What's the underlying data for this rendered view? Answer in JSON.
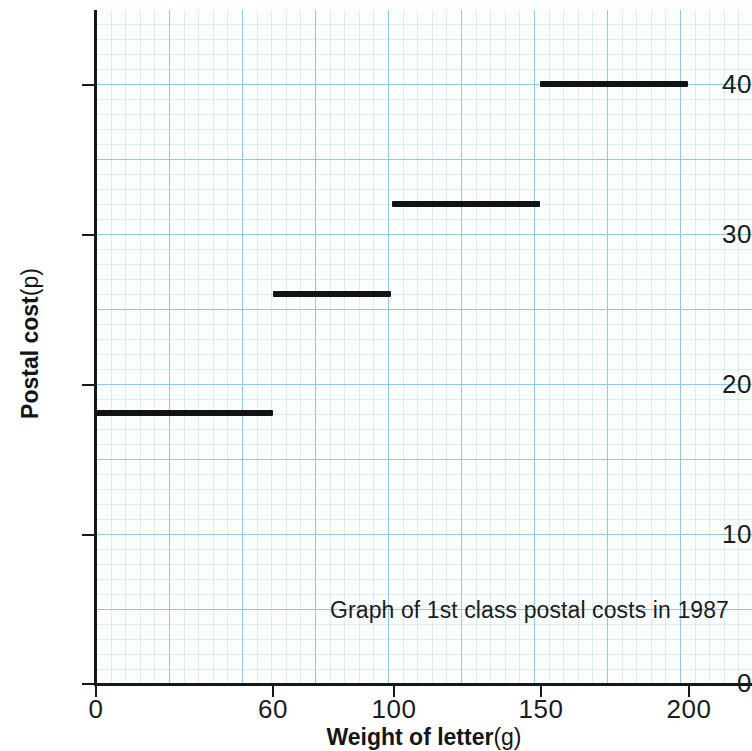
{
  "chart_data": {
    "type": "line",
    "subtype": "step",
    "title": "",
    "annotation": "Graph of 1st class postal costs in 1987",
    "xlabel_bold": "Weight of letter",
    "xlabel_unit": "(g)",
    "ylabel_bold": "Postal cost",
    "ylabel_unit": "(p)",
    "xlim": [
      0,
      225
    ],
    "ylim": [
      0,
      45
    ],
    "x_ticks": [
      0,
      60,
      100,
      150,
      200
    ],
    "x_tick_labels": [
      "0",
      "60",
      "100",
      "150",
      "200"
    ],
    "y_ticks": [
      0,
      10,
      20,
      30,
      40
    ],
    "y_tick_labels": [
      "0",
      "10",
      "20",
      "30",
      "40"
    ],
    "grid": "graph-paper light blue, major and minor",
    "legend": "none",
    "line_color": "#121315",
    "grid_color": "#6ebedc",
    "steps": [
      {
        "x_start": 0,
        "x_end": 60,
        "value": 18,
        "label": "0-60 g : 18p"
      },
      {
        "x_start": 60,
        "x_end": 100,
        "value": 26,
        "label": "60-100 g : 26p"
      },
      {
        "x_start": 100,
        "x_end": 150,
        "value": 32,
        "label": "100-150 g : 32p"
      },
      {
        "x_start": 150,
        "x_end": 200,
        "value": 40,
        "label": "150-200 g : 40p"
      }
    ],
    "categories": [
      "0-60",
      "60-100",
      "100-150",
      "150-200"
    ],
    "values": [
      18,
      26,
      32,
      40
    ]
  },
  "axis": {
    "y_tick_0": "0",
    "y_tick_10": "10",
    "y_tick_20": "20",
    "y_tick_30": "30",
    "y_tick_40": "40",
    "x_tick_0": "0",
    "x_tick_60": "60",
    "x_tick_100": "100",
    "x_tick_150": "150",
    "x_tick_200": "200"
  }
}
